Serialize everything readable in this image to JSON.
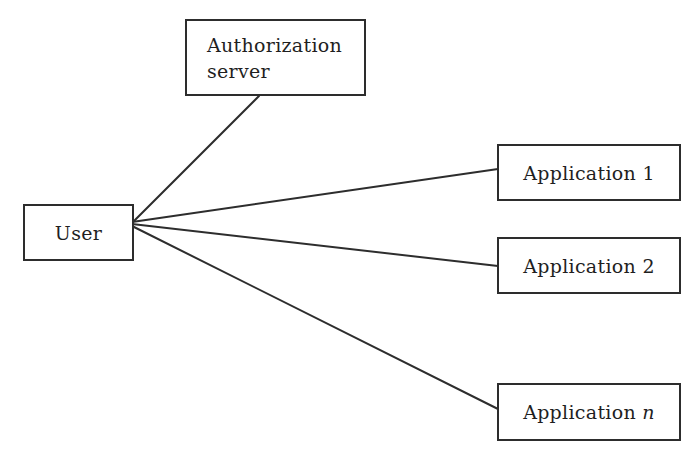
{
  "nodes": {
    "auth_server": {
      "line1": "Authorization",
      "line2": "server"
    },
    "user": {
      "label": "User"
    },
    "app1": {
      "label": "Application 1"
    },
    "app2": {
      "label": "Application 2"
    },
    "app_n": {
      "label": "Application ",
      "variable": "n"
    }
  },
  "edges": [
    {
      "from": "user",
      "to": "auth_server"
    },
    {
      "from": "user",
      "to": "app1"
    },
    {
      "from": "user",
      "to": "app2"
    },
    {
      "from": "user",
      "to": "app_n"
    }
  ],
  "colors": {
    "line": "#2d2d2d",
    "border": "#2d2d2d",
    "text": "#1f1f1f",
    "background": "#ffffff"
  }
}
